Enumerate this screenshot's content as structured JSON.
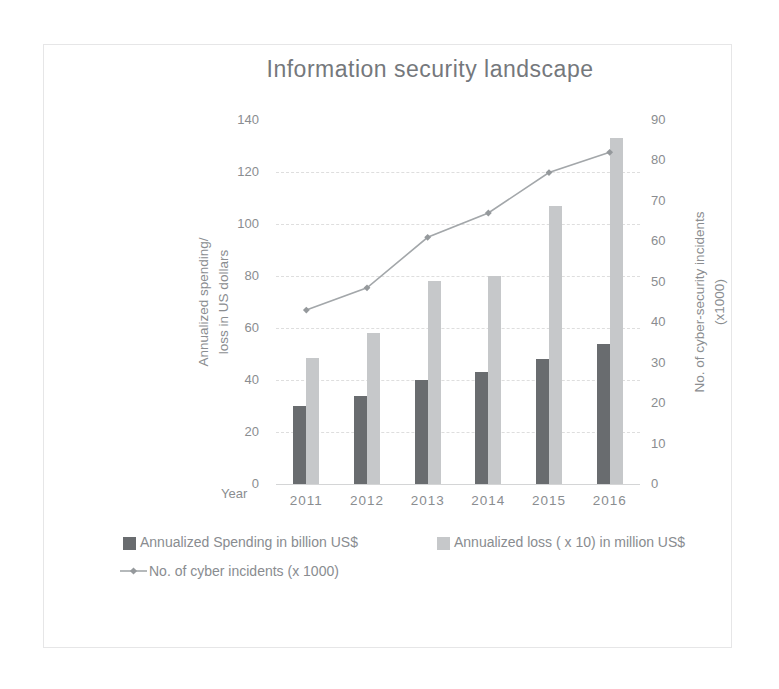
{
  "chart_data": {
    "type": "combo",
    "title": "Information security landscape",
    "categories": [
      "2011",
      "2012",
      "2013",
      "2014",
      "2015",
      "2016"
    ],
    "series": [
      {
        "name": "Annualized Spending in billion US$",
        "type": "bar",
        "axis": "left",
        "color": "#696c6f",
        "values": [
          30,
          34,
          40,
          43,
          48,
          54
        ]
      },
      {
        "name": "Annualized loss ( x 10) in million US$",
        "type": "bar",
        "axis": "left",
        "color": "#c6c8ca",
        "values": [
          48.5,
          58,
          78,
          80,
          107,
          133
        ]
      },
      {
        "name": "No. of cyber incidents (x 1000)",
        "type": "line",
        "axis": "right",
        "color": "#a3a7aa",
        "marker_color": "#95999c",
        "values": [
          43,
          48.5,
          61,
          67,
          77,
          82
        ]
      }
    ],
    "left_axis": {
      "title": "Annualized spending/ loss in US dollars",
      "title_lines": [
        "Annualized spending/",
        "loss in US dollars"
      ],
      "min": 0,
      "max": 140,
      "step": 20,
      "ticks": [
        0,
        20,
        40,
        60,
        80,
        100,
        120,
        140
      ]
    },
    "right_axis": {
      "title": "No. of cyber-security incidents (x1000)",
      "title_lines": [
        "No. of cyber-security incidents",
        "(x1000)"
      ],
      "min": 0,
      "max": 90,
      "step": 10,
      "ticks": [
        0,
        10,
        20,
        30,
        40,
        50,
        60,
        70,
        80,
        90
      ]
    },
    "x_axis": {
      "title": "Year"
    },
    "legend_position": "bottom",
    "grid": true
  },
  "colors": {
    "text": "#8a8d90",
    "grid": "#dedede",
    "axis_line": "#d4d5d6",
    "frame_border": "#e6e6e7"
  }
}
